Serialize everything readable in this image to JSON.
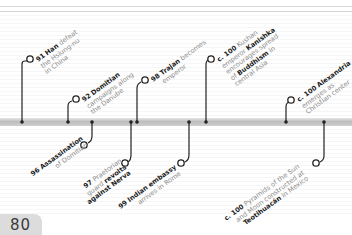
{
  "page_number": "80",
  "events_above": [
    {
      "year": "91",
      "bold": "Han",
      "text": "defeat",
      "lines": [
        "the Hsiung-nu",
        "in China"
      ]
    },
    {
      "year": "92",
      "bold": "Domitian",
      "text": "",
      "lines": [
        "campaigns along",
        "the Danube"
      ]
    },
    {
      "year": "98",
      "bold": "Trajan",
      "text": "becomes",
      "lines": [
        "emperor"
      ]
    },
    {
      "year": "c. 100",
      "bold": "",
      "text": "Kushan",
      "lines_html_parts": [
        [
          "emperor ",
          "Kanishka",
          ""
        ],
        [
          "encourages spread",
          "",
          ""
        ],
        [
          "of ",
          "Buddhism",
          " in"
        ],
        [
          "central Asia",
          "",
          ""
        ]
      ]
    },
    {
      "year": "c. 100",
      "bold": "Alexandria",
      "text": "",
      "lines": [
        "emerges as",
        "Christian center"
      ]
    }
  ],
  "events_below": [
    {
      "year": "96",
      "bold": "Assassination",
      "lines": [
        "of Domitian"
      ]
    },
    {
      "year": "97",
      "text": "Praetorian",
      "lines_parts": [
        [
          "guard ",
          "revolts",
          ""
        ],
        [
          "",
          "against Nerva",
          ""
        ]
      ]
    },
    {
      "year": "99",
      "bold": "Indian embassy",
      "lines": [
        "arrives in Rome"
      ]
    },
    {
      "year": "c. 100",
      "text": "Pyramids of the Sun",
      "lines_parts": [
        [
          "and Moon constructed at",
          "",
          ""
        ],
        [
          "",
          "Teotihuacán",
          " in Mexico"
        ]
      ]
    }
  ],
  "labels": {
    "e91_year": "91",
    "e91_bold": "Han",
    "e91_t1": " defeat",
    "e91_l2": "the Hsiung-nu",
    "e91_l3": "in China",
    "e92_year": "92",
    "e92_bold": "Domitian",
    "e92_l2": "campaigns along",
    "e92_l3": "the Danube",
    "e98_year": "98",
    "e98_bold": "Trajan",
    "e98_t1": " becomes",
    "e98_l2": "emperor",
    "ek_year": "c. 100",
    "ek_t1": " Kushan",
    "ek_l2a": "emperor ",
    "ek_l2b": "Kanishka",
    "ek_l3": "encourages spread",
    "ek_l4a": "of ",
    "ek_l4b": "Buddhism",
    "ek_l4c": " in",
    "ek_l5": "central Asia",
    "ea_year": "c. 100",
    "ea_bold": "Alexandria",
    "ea_l2": "emerges as",
    "ea_l3": "Christian center",
    "e96_year": "96",
    "e96_bold": "Assassination",
    "e96_l2": "of Domitian",
    "e97_year": "97",
    "e97_t1": " Praetorian",
    "e97_l2a": "guard ",
    "e97_l2b": "revolts",
    "e97_l3": "against Nerva",
    "e99_year": "99",
    "e99_bold": "Indian embassy",
    "e99_l2": "arrives in Rome",
    "ep_year": "c. 100",
    "ep_t1": " Pyramids of the Sun",
    "ep_l2": "and Moon constructed at",
    "ep_l3a": "Teotihuacán",
    "ep_l3b": " in Mexico"
  },
  "colors": {
    "bar": "#c4c4c4",
    "line": "#222222",
    "label_bold": "#222222",
    "label_text": "#8a8a8a",
    "page_tab": "#dcdcdc"
  }
}
